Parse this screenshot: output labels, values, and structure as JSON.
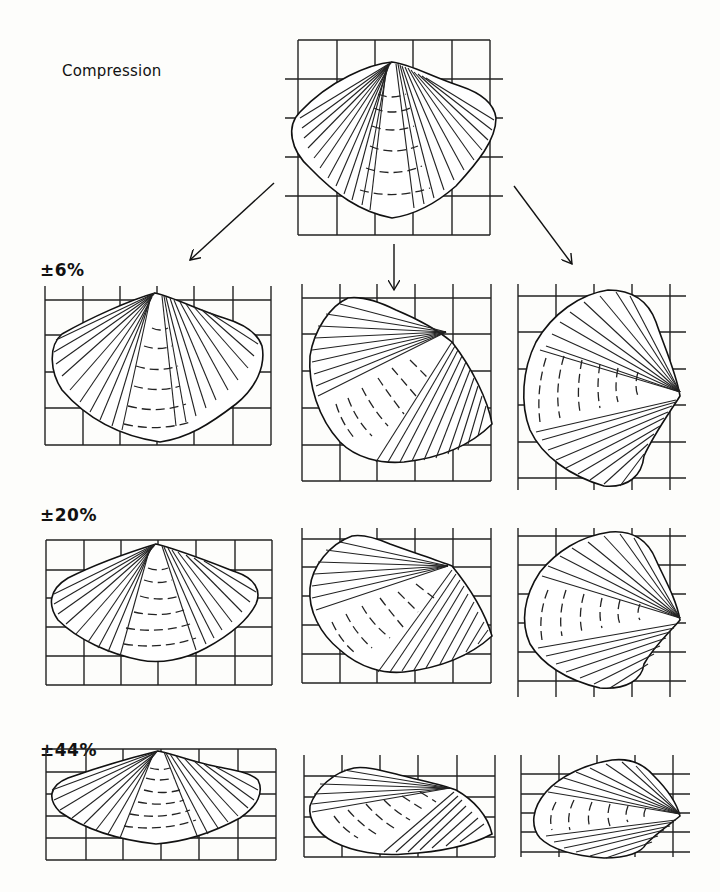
{
  "figure": {
    "title": "Compression",
    "row_labels": [
      "±6%",
      "±20%",
      "±44%"
    ],
    "original": {
      "name": "undeformed brachiopod shell",
      "grid": {
        "cols": 5,
        "rows": 5
      }
    },
    "orientations": [
      "symmetric (hinge up)",
      "oblique (rotated)",
      "lateral (hinge right)"
    ],
    "arrows": [
      "to-left-column",
      "to-middle-column",
      "to-right-column"
    ],
    "panels": [
      {
        "row": "±6%",
        "orientation": "symmetric"
      },
      {
        "row": "±6%",
        "orientation": "oblique"
      },
      {
        "row": "±6%",
        "orientation": "lateral"
      },
      {
        "row": "±20%",
        "orientation": "symmetric"
      },
      {
        "row": "±20%",
        "orientation": "oblique"
      },
      {
        "row": "±20%",
        "orientation": "lateral"
      },
      {
        "row": "±44%",
        "orientation": "symmetric"
      },
      {
        "row": "±44%",
        "orientation": "oblique"
      },
      {
        "row": "±44%",
        "orientation": "lateral"
      }
    ]
  },
  "colors": {
    "ink": "#111111",
    "paper": "#fdfdfb"
  }
}
